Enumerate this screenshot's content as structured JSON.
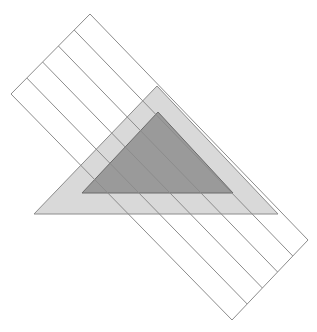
{
  "figure": {
    "title": "overlapping-shapes-diagram",
    "canvas": {
      "width": 317,
      "height": 332,
      "background": "#ffffff"
    },
    "shapes": [
      {
        "id": "striped-rectangle",
        "name": "striped-rotated-rectangle",
        "type": "rectangle",
        "rotation_deg": 45,
        "fill": "none",
        "fill_opacity": 0,
        "stroke": "#8c8c8c",
        "stroke_width": 1,
        "corners": [
          [
            90,
            14
          ],
          [
            308,
            240
          ],
          [
            232,
            320
          ],
          [
            11,
            94
          ]
        ],
        "band_count": 5,
        "band_divider_lines": [
          [
            [
              74,
              31
            ],
            [
              214,
              176
            ]
          ],
          [
            [
              58,
              47
            ],
            [
              197,
              192
            ]
          ],
          [
            [
              42,
              63
            ],
            [
              181,
              208
            ]
          ],
          [
            [
              26,
              79
            ],
            [
              165,
              224
            ]
          ]
        ]
      },
      {
        "id": "light-triangle",
        "name": "light-gray-triangle",
        "type": "triangle",
        "fill": "#d9d9d9",
        "fill_opacity": 1,
        "stroke": "#8c8c8c",
        "stroke_width": 1,
        "vertices": [
          [
            157,
            86
          ],
          [
            278,
            214
          ],
          [
            34,
            214
          ]
        ]
      },
      {
        "id": "dark-triangle",
        "name": "dark-gray-triangle",
        "type": "triangle",
        "fill": "#9a9a9a",
        "fill_opacity": 1,
        "stroke": "#6b6b6b",
        "stroke_width": 1,
        "vertices": [
          [
            158,
            112
          ],
          [
            233,
            193
          ],
          [
            82,
            193
          ]
        ]
      }
    ],
    "colors": {
      "background": "#ffffff",
      "outline_gray": "#8c8c8c",
      "light_fill": "#d9d9d9",
      "dark_fill": "#9a9a9a",
      "dark_outline": "#6b6b6b",
      "overlap_light_band": "#c9c9c9",
      "overlap_dark_band": "#8e8e8e"
    }
  }
}
